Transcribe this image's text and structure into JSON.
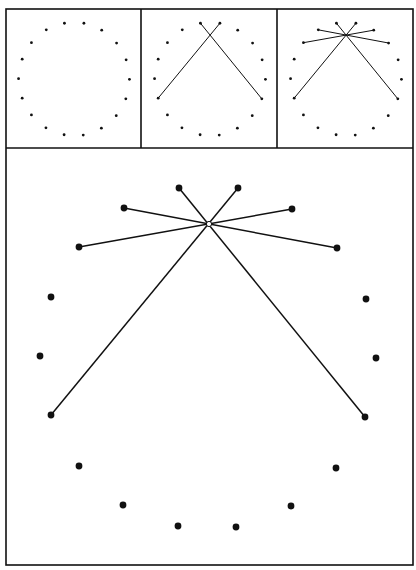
{
  "figure": {
    "ink_color": "#111111",
    "background": "#ffffff",
    "frame": {
      "left": 6,
      "top": 9,
      "right": 413,
      "bottom": 565,
      "divider_y": 148,
      "divider_x": [
        141,
        277
      ]
    },
    "main_panel": {
      "points": [
        [
          179,
          188
        ],
        [
          238,
          188
        ],
        [
          292,
          209
        ],
        [
          337,
          248
        ],
        [
          366,
          299
        ],
        [
          376,
          358
        ],
        [
          365,
          417
        ],
        [
          336,
          468
        ],
        [
          291,
          506
        ],
        [
          236,
          527
        ],
        [
          178,
          526
        ],
        [
          123,
          505
        ],
        [
          79,
          466
        ],
        [
          51,
          415
        ],
        [
          40,
          356
        ],
        [
          51,
          297
        ],
        [
          79,
          247
        ],
        [
          124,
          208
        ]
      ],
      "crossing_point": [
        209,
        224
      ],
      "lines": [
        [
          [
            51,
            415
          ],
          [
            238,
            188
          ]
        ],
        [
          [
            365,
            417
          ],
          [
            179,
            188
          ]
        ],
        [
          [
            79,
            247
          ],
          [
            292,
            209
          ]
        ],
        [
          [
            337,
            248
          ],
          [
            124,
            208
          ]
        ]
      ],
      "dot_radius": 3.4
    },
    "thumbnails": [
      {
        "name": "step-1",
        "origin": [
          6,
          9
        ],
        "lines_shown": 0
      },
      {
        "name": "step-2",
        "origin": [
          142,
          9
        ],
        "lines_shown": 2
      },
      {
        "name": "step-3",
        "origin": [
          278,
          9
        ],
        "lines_shown": 4
      }
    ],
    "thumbnail_scale": 0.33,
    "thumbnail_center_offset": [
      68,
      70
    ],
    "thumbnail_dot_radius": 1.4
  }
}
